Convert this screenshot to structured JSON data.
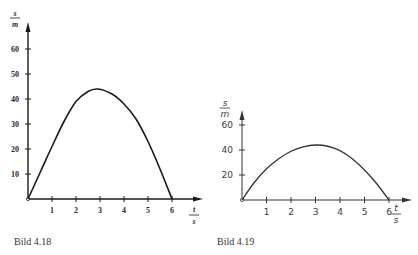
{
  "chart_data": [
    {
      "type": "line",
      "caption": "Bild 4.18",
      "title": "",
      "xlabel": "t / s",
      "ylabel": "s / m",
      "x_axis_label_num": "t",
      "x_axis_label_den": "s",
      "y_axis_label_num": "s",
      "y_axis_label_den": "m",
      "xlim": [
        0,
        6.5
      ],
      "ylim": [
        0,
        65
      ],
      "xticks": [
        1,
        2,
        3,
        4,
        5,
        6
      ],
      "xtick_labels": [
        "1",
        "2",
        "3",
        "4",
        "5",
        "6"
      ],
      "yticks": [
        10,
        20,
        30,
        40,
        50,
        60
      ],
      "ytick_labels": [
        "10",
        "20",
        "30",
        "40",
        "50",
        "60"
      ],
      "grid": false,
      "series": [
        {
          "name": "s(t)",
          "x": [
            0,
            0.5,
            1.0,
            1.5,
            2.0,
            2.5,
            2.9,
            3.5,
            4.0,
            4.5,
            5.0,
            5.5,
            6.0
          ],
          "y": [
            0,
            10.5,
            21,
            31,
            39,
            43,
            44,
            42,
            38,
            32,
            23,
            12,
            0
          ]
        }
      ]
    },
    {
      "type": "line",
      "caption": "Bild 4.19",
      "title": "",
      "xlabel": "t / s",
      "ylabel": "s / m",
      "x_axis_label_num": "t",
      "x_axis_label_den": "s",
      "y_axis_label_num": "s",
      "y_axis_label_den": "m",
      "xlim": [
        0,
        6.5
      ],
      "ylim": [
        0,
        65
      ],
      "xticks": [
        1,
        2,
        3,
        4,
        5,
        6
      ],
      "xtick_labels": [
        "1",
        "2",
        "3",
        "4",
        "5",
        "6"
      ],
      "yticks": [
        20,
        40,
        60
      ],
      "ytick_labels": [
        "20",
        "40",
        "60"
      ],
      "grid": false,
      "series": [
        {
          "name": "s(t)",
          "x": [
            0,
            0.5,
            1.0,
            1.5,
            2.0,
            2.5,
            3.0,
            3.5,
            4.0,
            4.5,
            5.0,
            5.5,
            6.0
          ],
          "y": [
            0,
            14,
            25,
            33,
            39,
            42.5,
            44,
            43,
            39.5,
            33,
            24,
            13,
            0
          ]
        }
      ]
    }
  ]
}
